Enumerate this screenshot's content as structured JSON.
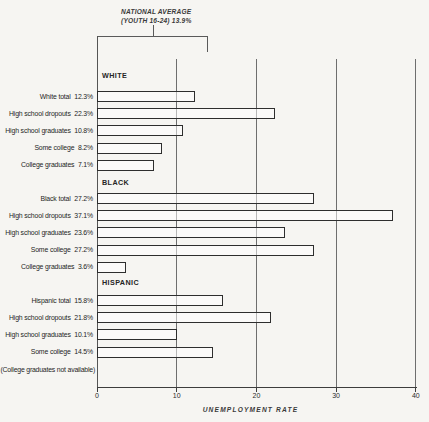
{
  "chart_data": {
    "type": "bar",
    "orientation": "horizontal",
    "xlabel": "UNEMPLOYMENT RATE",
    "xlim": [
      0,
      40
    ],
    "x_ticks": [
      0,
      10,
      20,
      30,
      40
    ],
    "grid": "vertical",
    "national_average": {
      "label_line1": "NATIONAL AVERAGE",
      "label_line2": "(YOUTH 16-24)  13.9%",
      "value": 13.9
    },
    "groups": [
      {
        "name": "WHITE",
        "bars": [
          {
            "label": "White total",
            "value": 12.3,
            "value_label": "12.3%"
          },
          {
            "label": "High school dropouts",
            "value": 22.3,
            "value_label": "22.3%"
          },
          {
            "label": "High school graduates",
            "value": 10.8,
            "value_label": "10.8%"
          },
          {
            "label": "Some college",
            "value": 8.2,
            "value_label": "8.2%"
          },
          {
            "label": "College graduates",
            "value": 7.1,
            "value_label": "7.1%"
          }
        ]
      },
      {
        "name": "BLACK",
        "bars": [
          {
            "label": "Black total",
            "value": 27.2,
            "value_label": "27.2%"
          },
          {
            "label": "High school dropouts",
            "value": 37.1,
            "value_label": "37.1%"
          },
          {
            "label": "High school graduates",
            "value": 23.6,
            "value_label": "23.6%"
          },
          {
            "label": "Some college",
            "value": 27.2,
            "value_label": "27.2%"
          },
          {
            "label": "College graduates",
            "value": 3.6,
            "value_label": "3.6%"
          }
        ]
      },
      {
        "name": "HISPANIC",
        "bars": [
          {
            "label": "Hispanic total",
            "value": 15.8,
            "value_label": "15.8%"
          },
          {
            "label": "High school dropouts",
            "value": 21.8,
            "value_label": "21.8%"
          },
          {
            "label": "High school graduates",
            "value": 10.1,
            "value_label": "10.1%"
          },
          {
            "label": "Some college",
            "value": 14.5,
            "value_label": "14.5%"
          }
        ],
        "footnote": "(College graduates not available)"
      }
    ],
    "colors": {
      "background": "#f6f5f2",
      "bar_outline": "#2e2e2e",
      "gridline": "#6e6e6e",
      "text": "#2b2b2b"
    }
  }
}
